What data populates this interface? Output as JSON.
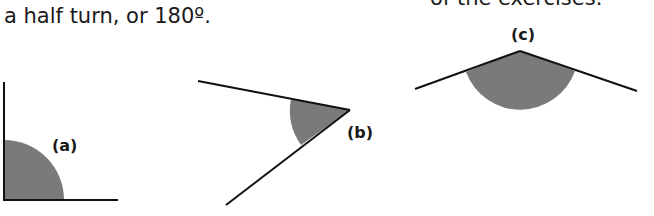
{
  "text": {
    "line": "a half turn, or 180º.",
    "clipped_top_right": "of the exercises."
  },
  "figures": [
    {
      "label": "(a)",
      "description": "right angle with shaded quarter-circle sector"
    },
    {
      "label": "(b)",
      "description": "acute angle with shaded sector"
    },
    {
      "label": "(c)",
      "description": "obtuse angle with shaded sector"
    }
  ],
  "colors": {
    "line": "#111111",
    "shade": "#7a7a7a"
  }
}
